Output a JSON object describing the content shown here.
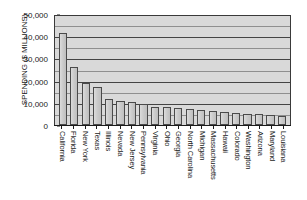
{
  "chart_data": {
    "type": "bar",
    "title": "",
    "xlabel": "",
    "ylabel": "SPENDING ($ MILLIONS)",
    "ylim": [
      0,
      50000
    ],
    "ytick_labels": [
      "50,000",
      "40,000",
      "30,000",
      "20,000",
      "10,000",
      "0"
    ],
    "ytick_values": [
      50000,
      40000,
      30000,
      20000,
      10000,
      0
    ],
    "grid": true,
    "grid_major_interval": 10000,
    "grid_minor_interval": 5000,
    "legend": "none",
    "categories": [
      "California",
      "Florida",
      "New York",
      "Texas",
      "Illinois",
      "Nevada",
      "New Jersey",
      "Pennsylvania",
      "Virginia",
      "Ohio",
      "Georgia",
      "North Carolina",
      "Michigan",
      "Massachusetts",
      "Hawaii",
      "Colorado",
      "Washington",
      "Arizona",
      "Maryland",
      "Louisiana"
    ],
    "values": [
      41500,
      26000,
      18800,
      17200,
      11700,
      11000,
      10200,
      9400,
      8200,
      8000,
      7500,
      7200,
      6700,
      6300,
      5700,
      5400,
      4900,
      4800,
      4600,
      4000
    ],
    "colors": {
      "bar_fill": "#c9c9c9",
      "bar_border": "#4a4a4a",
      "plot_background": "#d9d9d9",
      "gridline": "#444444",
      "gridline_minor": "#8f8f8f",
      "axis": "#1a1a1a",
      "text": "#1a1a1a",
      "figure_background": "#ffffff"
    }
  }
}
